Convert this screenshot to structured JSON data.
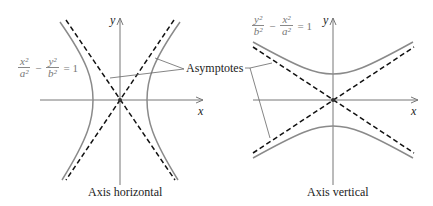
{
  "left_panel": {
    "caption": "Axis horizontal",
    "equation": {
      "t1_num": "x²",
      "t1_den": "a²",
      "op": "−",
      "t2_num": "y²",
      "t2_den": "b²",
      "rhs": "= 1"
    },
    "x_axis_label": "x",
    "y_axis_label": "y"
  },
  "right_panel": {
    "caption": "Axis vertical",
    "equation": {
      "t1_num": "y²",
      "t1_den": "b²",
      "op": "−",
      "t2_num": "x²",
      "t2_den": "a²",
      "rhs": "= 1"
    },
    "x_axis_label": "x",
    "y_axis_label": "y"
  },
  "annotation": {
    "label": "Asymptotes"
  },
  "colors": {
    "curve": "#8a8a8a",
    "asymptote": "#111111",
    "axis": "#777777"
  }
}
